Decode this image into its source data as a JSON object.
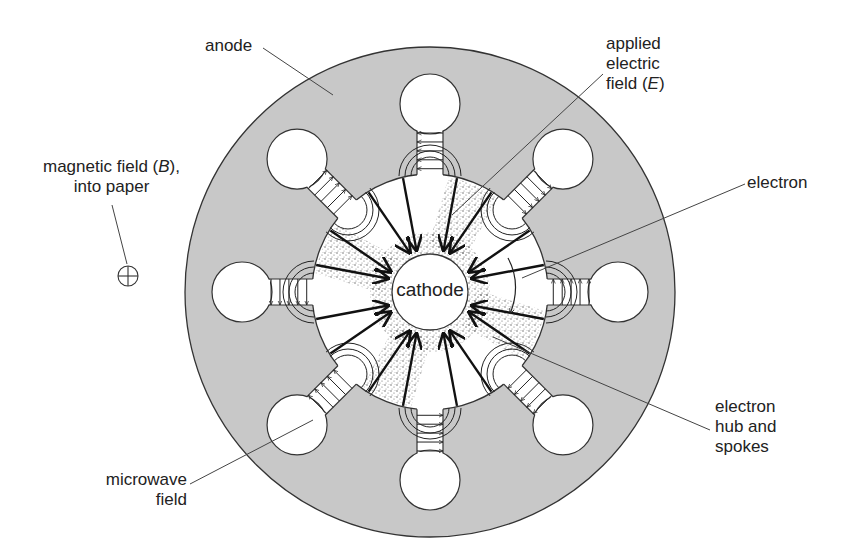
{
  "diagram": {
    "type": "magnetron cross-section",
    "colors": {
      "anode_fill": "#c8c8c8",
      "outline": "#333333",
      "background": "#ffffff",
      "stipple": "#555555",
      "arrow": "#111111"
    },
    "geometry": {
      "center": [
        430,
        292
      ],
      "anode_outer_radius": 245,
      "cavity_radius": 118,
      "cathode_radius": 38,
      "resonator_count": 8,
      "resonator_hole_radius": 30,
      "resonator_distance": 188,
      "slot_width": 26
    },
    "labels": {
      "anode": "anode",
      "applied_field": [
        "applied",
        "electric",
        "field (E)"
      ],
      "magnetic_field": [
        "magnetic field (B),",
        "into paper"
      ],
      "electron": "electron",
      "cathode": "cathode",
      "hub_spokes": [
        "electron",
        "hub and",
        "spokes"
      ],
      "microwave": [
        "microwave",
        "field"
      ]
    },
    "symbols": {
      "magnetic_field_symbol": "circle-plus (into page)"
    }
  }
}
